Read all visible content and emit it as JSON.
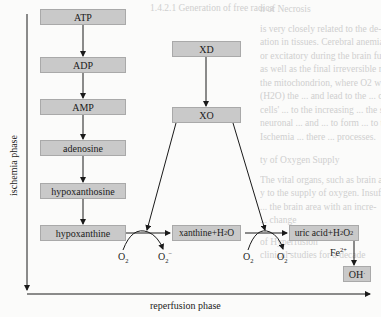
{
  "diagram": {
    "axes": {
      "vertical_label": "ischemia phase",
      "horizontal_label": "reperfusion phase"
    },
    "ischemia_chain": [
      {
        "id": "atp",
        "label": "ATP"
      },
      {
        "id": "adp",
        "label": "ADP"
      },
      {
        "id": "amp",
        "label": "AMP"
      },
      {
        "id": "adenosine",
        "label": "adenosine"
      },
      {
        "id": "hypoxanthosine",
        "label": "hypoxanthosine"
      },
      {
        "id": "hypoxanthine",
        "label": "hypoxanthine"
      }
    ],
    "enzyme_chain": [
      {
        "id": "xd",
        "label": "XD"
      },
      {
        "id": "xo",
        "label": "XO"
      }
    ],
    "products": {
      "xanthine": {
        "main": "xanthine+H",
        "sub": "2",
        "tail": "O"
      },
      "uric_acid": {
        "main": "uric acid+H",
        "sub1": "2",
        "mid": "O",
        "sub2": "2"
      },
      "oh": {
        "label": "OH",
        "sup": "·"
      }
    },
    "reaction_labels": {
      "o2_in": {
        "main": "O",
        "sub": "2"
      },
      "o2_out": {
        "main": "O",
        "sub": "2",
        "sup": "−"
      },
      "fe": {
        "main": "Fe",
        "sup": "2+"
      }
    },
    "background_text": [
      "1.4.2.1   Generation of free radica",
      "n of Necrosis",
      "Oxygen free radicals (OFRs) are...",
      "is very closely related to the de-",
      "ation in tissues. Cerebral anemia (ischemic",
      "or excitatory during the brain function, ischemic time and",
      "as well as the final irreversible reperfusion injury. The hyper-",
      "the mitochondrion, where O2 will be ... when ischemic period lasts",
      "(H2O) the ... and lead to the ... of more than 30 minutes. Additional",
      "cells' ... to the increasing ... the secondary injury from other",
      "neuronal ... and ... to form ... to the ischemic area depends on differ-",
      "Ischemia ... there ... processes.",
      "ty of Oxygen Supply",
      "The vital organs, such as brain and",
      "y to the supply of oxygen. Insuffi-",
      "... the brain area with an incre-",
      "... change",
      "of Hyperfusion",
      "clinical studies for a decade"
    ],
    "colors": {
      "box_fill": "#c9c9c9",
      "box_border": "#a9a9a9",
      "line": "#1a1a1a",
      "background": "#fbfbfa"
    }
  }
}
